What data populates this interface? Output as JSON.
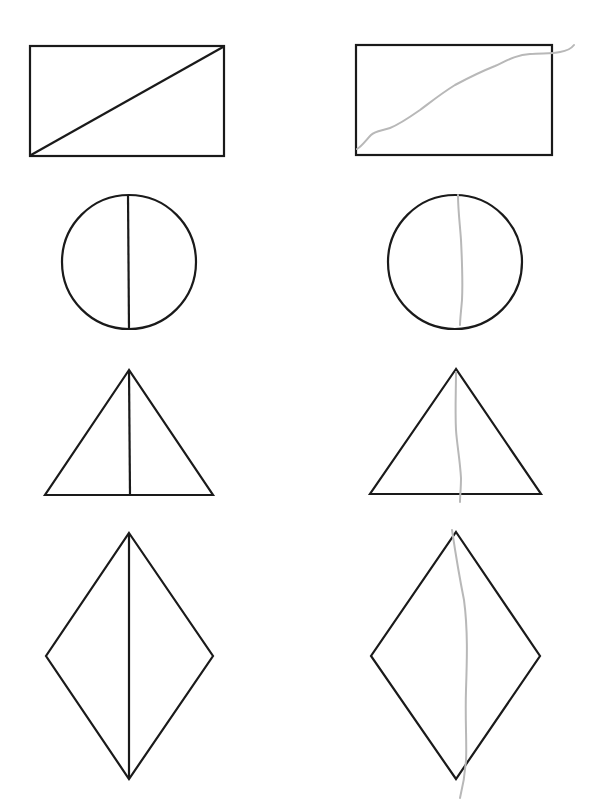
{
  "diagram": {
    "title": "",
    "colors": {
      "outline": "#1a1a1a",
      "reference_line": "#1a1a1a",
      "drawn_line": "#b8b8b8",
      "background": "#ffffff"
    },
    "columns": [
      {
        "id": "reference",
        "description": "Shapes with a straight bisecting line"
      },
      {
        "id": "attempt",
        "description": "Same shapes with a hand-drawn gray bisecting line"
      }
    ],
    "rows": [
      {
        "shape": "rectangle",
        "reference": {
          "outline": "rect 30,46 to 224,156",
          "line": "diagonal from bottom-left to top-right"
        },
        "attempt": {
          "outline": "rect 356,45 to 552,155",
          "line": "wavy gray diagonal from bottom-left rising past top-right edge"
        }
      },
      {
        "shape": "circle",
        "reference": {
          "center": [
            129,
            262
          ],
          "radius": 67,
          "line": "vertical diameter"
        },
        "attempt": {
          "center": [
            455,
            262
          ],
          "radius": 67,
          "line": "slightly curved gray vertical line"
        }
      },
      {
        "shape": "triangle",
        "reference": {
          "points": [
            [
              129,
              370
            ],
            [
              45,
              495
            ],
            [
              213,
              495
            ]
          ],
          "line": "vertical altitude from apex"
        },
        "attempt": {
          "points": [
            [
              456,
              369
            ],
            [
              370,
              494
            ],
            [
              541,
              494
            ]
          ],
          "line": "wavy gray vertical line from apex"
        }
      },
      {
        "shape": "rhombus",
        "reference": {
          "points": [
            [
              129,
              533
            ],
            [
              213,
              656
            ],
            [
              129,
              779
            ],
            [
              46,
              656
            ]
          ],
          "line": "vertical diagonal"
        },
        "attempt": {
          "points": [
            [
              456,
              532
            ],
            [
              540,
              656
            ],
            [
              456,
              779
            ],
            [
              371,
              656
            ]
          ],
          "line": "curved gray vertical line extending below"
        }
      }
    ]
  }
}
